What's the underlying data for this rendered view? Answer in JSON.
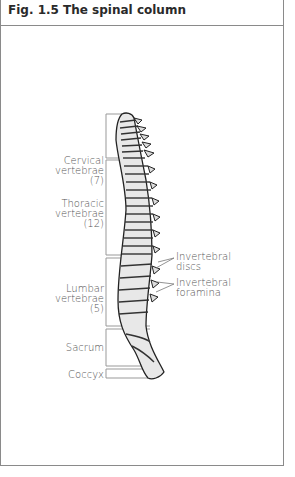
{
  "figure": {
    "title": "Fig. 1.5 The spinal column"
  },
  "labels": {
    "cervical": {
      "line1": "Cervical",
      "line2": "vertebrae",
      "count": "(7)"
    },
    "thoracic": {
      "line1": "Thoracic",
      "line2": "vertebrae",
      "count": "(12)"
    },
    "lumbar": {
      "line1": "Lumbar",
      "line2": "vertebrae",
      "count": "(5)"
    },
    "sacrum": "Sacrum",
    "coccyx": "Coccyx",
    "discs": {
      "line1": "Invertebral",
      "line2": "discs"
    },
    "foramina": {
      "line1": "Invertebral",
      "line2": "foramina"
    }
  },
  "colors": {
    "border": "#8a8a8a",
    "text": "#555555",
    "title": "#2a2a2a",
    "bone": "#e4e4e4",
    "outline": "#222222"
  }
}
